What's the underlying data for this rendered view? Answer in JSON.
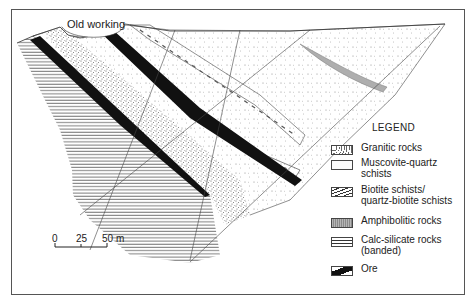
{
  "figure": {
    "annotation": "Old working",
    "scale_bar": {
      "ticks": [
        "0",
        "25",
        "50 m"
      ],
      "unit": "m",
      "length_m": 50
    }
  },
  "legend": {
    "title": "LEGEND",
    "items": [
      {
        "id": "granitic",
        "label": [
          "Granitic rocks"
        ],
        "pattern": "dense-stipple"
      },
      {
        "id": "muscovite",
        "label": [
          "Muscovite-quartz",
          "schists"
        ],
        "pattern": "sparse-stipple"
      },
      {
        "id": "biotite",
        "label": [
          "Biotite schists/",
          "quartz-biotite schists"
        ],
        "pattern": "dashed-schist"
      },
      {
        "id": "amphibolitic",
        "label": [
          "Amphibolitic rocks"
        ],
        "pattern": "grey-vertical-hatch"
      },
      {
        "id": "calc-silicate",
        "label": [
          "Calc-silicate rocks",
          "(banded)"
        ],
        "pattern": "horizontal-banding"
      },
      {
        "id": "ore",
        "label": [
          "Ore"
        ],
        "pattern": "solid-black"
      }
    ]
  },
  "colors": {
    "ore": "#111111",
    "amphibolite": "#a8a8a8",
    "line": "#333333",
    "frame": "#555555"
  }
}
